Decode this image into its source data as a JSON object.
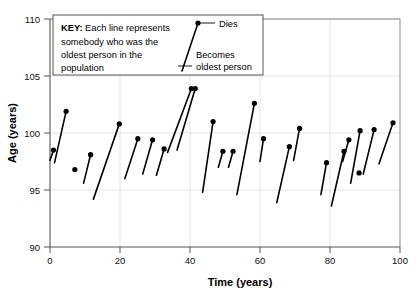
{
  "chart_data": {
    "type": "line",
    "title": "",
    "xlabel": "Time (years)",
    "ylabel": "Age (years)",
    "xlim": [
      0,
      100
    ],
    "ylim": [
      90,
      110
    ],
    "xticks": [
      0,
      20,
      40,
      60,
      80,
      100
    ],
    "yticks": [
      90,
      95,
      100,
      105,
      110
    ],
    "xticklabels": [
      "0",
      "20",
      "40",
      "60",
      "80",
      "100"
    ],
    "yticklabels": [
      "90",
      "95",
      "100",
      "105",
      "110"
    ],
    "grid": true,
    "legend_position": "top-center",
    "series_description": "Each line segment represents one person: the lower-left endpoint is when they became the oldest person in the population, the upper-right endpoint (filled dot) is when they died.",
    "segments": [
      {
        "x_start": 0.0,
        "y_start": 97.6,
        "x_end": 1.0,
        "y_end": 98.5
      },
      {
        "x_start": 1.3,
        "y_start": 97.4,
        "x_end": 4.6,
        "y_end": 101.9
      },
      {
        "x_start": 6.9,
        "y_start": 96.7,
        "x_end": 7.1,
        "y_end": 96.8
      },
      {
        "x_start": 9.6,
        "y_start": 95.6,
        "x_end": 11.6,
        "y_end": 98.1
      },
      {
        "x_start": 12.4,
        "y_start": 94.2,
        "x_end": 19.8,
        "y_end": 100.8
      },
      {
        "x_start": 21.4,
        "y_start": 96.0,
        "x_end": 25.1,
        "y_end": 99.5
      },
      {
        "x_start": 26.5,
        "y_start": 96.4,
        "x_end": 29.3,
        "y_end": 99.4
      },
      {
        "x_start": 30.4,
        "y_start": 96.3,
        "x_end": 32.6,
        "y_end": 98.6
      },
      {
        "x_start": 33.6,
        "y_start": 98.3,
        "x_end": 40.4,
        "y_end": 103.9
      },
      {
        "x_start": 36.3,
        "y_start": 98.5,
        "x_end": 41.5,
        "y_end": 103.9
      },
      {
        "x_start": 43.6,
        "y_start": 94.8,
        "x_end": 46.6,
        "y_end": 101.0
      },
      {
        "x_start": 48.1,
        "y_start": 97.0,
        "x_end": 49.4,
        "y_end": 98.4
      },
      {
        "x_start": 51.0,
        "y_start": 97.0,
        "x_end": 52.3,
        "y_end": 98.4
      },
      {
        "x_start": 53.4,
        "y_start": 94.6,
        "x_end": 58.4,
        "y_end": 102.6
      },
      {
        "x_start": 60.0,
        "y_start": 97.5,
        "x_end": 61.0,
        "y_end": 99.5
      },
      {
        "x_start": 64.8,
        "y_start": 93.9,
        "x_end": 68.4,
        "y_end": 98.8
      },
      {
        "x_start": 69.6,
        "y_start": 97.6,
        "x_end": 71.3,
        "y_end": 100.4
      },
      {
        "x_start": 77.4,
        "y_start": 94.6,
        "x_end": 79.0,
        "y_end": 97.4
      },
      {
        "x_start": 80.4,
        "y_start": 93.6,
        "x_end": 84.0,
        "y_end": 98.4
      },
      {
        "x_start": 83.6,
        "y_start": 97.5,
        "x_end": 85.4,
        "y_end": 99.4
      },
      {
        "x_start": 85.9,
        "y_start": 95.6,
        "x_end": 88.6,
        "y_end": 100.2
      },
      {
        "x_start": 88.0,
        "y_start": 96.4,
        "x_end": 88.3,
        "y_end": 96.5
      },
      {
        "x_start": 89.5,
        "y_start": 96.4,
        "x_end": 92.6,
        "y_end": 100.3
      },
      {
        "x_start": 94.0,
        "y_start": 97.3,
        "x_end": 98.0,
        "y_end": 100.9
      }
    ]
  },
  "key": {
    "label_bold": "KEY:",
    "line1": " Each line represents",
    "line2": "somebody who was the",
    "line3": "oldest person in the",
    "line4": "population",
    "dies_label": "Dies",
    "becomes_label_1": "Becomes",
    "becomes_label_2": "oldest person"
  }
}
